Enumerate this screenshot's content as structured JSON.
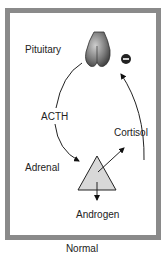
{
  "diagram": {
    "labels": {
      "pituitary": "Pituitary",
      "acth": "ACTH",
      "adrenal": "Adrenal",
      "cortisol": "Cortisol",
      "androgen": "Androgen"
    },
    "feedback_sign": "−",
    "caption": "Normal",
    "colors": {
      "frame": "#8a8a8a",
      "triangle_fill": "#d8d8d8",
      "pituitary_fill": "#777777"
    }
  }
}
